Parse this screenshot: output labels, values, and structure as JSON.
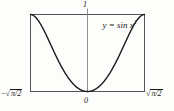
{
  "figure": {
    "title": "",
    "equation_label": "y = sin x",
    "equation_exponent": "2",
    "axis": {
      "y_top_label": "1",
      "origin_label": "0",
      "x_left_label_sign": "−",
      "x_left_radicand": "π/2",
      "x_right_radicand": "π/2",
      "radical_sign": "√"
    },
    "colors": {
      "curve": "#1a1a1a",
      "frame": "#4d4d4d",
      "axis": "#8c8c8c",
      "text": "#1a1a1a",
      "background": "#fdfdfc"
    }
  },
  "chart_data": {
    "type": "line",
    "title": "",
    "xlabel": "",
    "ylabel": "",
    "function": "y = sin(x^2)",
    "xlim": [
      -1.2533,
      1.2533
    ],
    "ylim": [
      0,
      1
    ],
    "xtick_labels": [
      "−√(π/2)",
      "0",
      "√(π/2)"
    ],
    "xtick_values": [
      -1.2533,
      0,
      1.2533
    ],
    "ytick_labels": [
      "1"
    ],
    "ytick_values": [
      1
    ],
    "grid": false,
    "legend": "none",
    "annotations": [
      {
        "text": "y = sin x²",
        "x": 0.35,
        "y": 0.86
      }
    ],
    "series": [
      {
        "name": "sin(x^2)",
        "x": [
          -1.2533,
          -1.2033,
          -1.1533,
          -1.1033,
          -1.0533,
          -1.0033,
          -0.9533,
          -0.9033,
          -0.8533,
          -0.8033,
          -0.7533,
          -0.7033,
          -0.6533,
          -0.6033,
          -0.5533,
          -0.5033,
          -0.4533,
          -0.4033,
          -0.3533,
          -0.3033,
          -0.2533,
          -0.2033,
          -0.1533,
          -0.1033,
          -0.0533,
          0.0,
          0.0533,
          0.1033,
          0.1533,
          0.2033,
          0.2533,
          0.3033,
          0.3533,
          0.4033,
          0.4533,
          0.5033,
          0.5533,
          0.6033,
          0.6533,
          0.7033,
          0.7533,
          0.8033,
          0.8533,
          0.9033,
          0.9533,
          1.0033,
          1.0533,
          1.1033,
          1.1533,
          1.2033,
          1.2533
        ],
        "y": [
          1.0,
          0.9906,
          0.9636,
          0.9196,
          0.86,
          0.7867,
          0.7021,
          0.6091,
          0.5106,
          0.4096,
          0.3091,
          0.2117,
          0.1198,
          0.0356,
          0.0,
          0.0,
          0.0,
          0.0,
          0.0,
          0.0,
          0.0,
          0.0,
          0.0,
          0.0,
          0.0,
          0.0,
          0.0,
          0.0,
          0.0,
          0.0,
          0.0,
          0.0,
          0.0,
          0.0,
          0.0,
          0.0,
          0.0,
          0.0356,
          0.1198,
          0.2117,
          0.3091,
          0.4096,
          0.5106,
          0.6091,
          0.7021,
          0.7867,
          0.86,
          0.9196,
          0.9636,
          0.9906,
          1.0
        ]
      }
    ]
  }
}
